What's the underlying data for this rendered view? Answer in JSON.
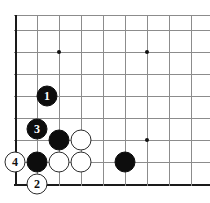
{
  "figure": {
    "kind": "go-board-diagram",
    "width": 210,
    "height": 203,
    "background_color": "#ffffff"
  },
  "board": {
    "line_color": "#8c8c8c",
    "edge_color": "#1a1a1a",
    "cell_size": 22,
    "vertical_lines_x": [
      15,
      37,
      59,
      81,
      103,
      125,
      147,
      169,
      191,
      213
    ],
    "horizontal_lines_y": [
      15,
      30,
      52,
      74,
      96,
      118,
      140,
      162,
      184
    ],
    "left_edge_x": 15,
    "bottom_edge_y": 184,
    "top_line_y": 15
  },
  "star_points": [
    {
      "name": "star-point-upper-left",
      "x": 59,
      "y": 52
    },
    {
      "name": "star-point-upper-right",
      "x": 147,
      "y": 52
    },
    {
      "name": "star-point-lower-left",
      "x": 59,
      "y": 140
    },
    {
      "name": "star-point-lower-right",
      "x": 147,
      "y": 140
    }
  ],
  "stones": [
    {
      "id": "stone-black-move-1",
      "color": "black",
      "label": "1",
      "x": 47,
      "y": 96
    },
    {
      "id": "stone-black-move-3",
      "color": "black",
      "label": "3",
      "x": 37,
      "y": 129
    },
    {
      "id": "stone-white-move-4",
      "color": "white",
      "label": "4",
      "x": 15,
      "y": 162
    },
    {
      "id": "stone-white-move-2",
      "color": "white",
      "label": "2",
      "x": 37,
      "y": 184
    },
    {
      "id": "stone-black-a",
      "color": "black",
      "label": "",
      "x": 59,
      "y": 140
    },
    {
      "id": "stone-black-b",
      "color": "black",
      "label": "",
      "x": 37,
      "y": 162
    },
    {
      "id": "stone-black-c",
      "color": "black",
      "label": "",
      "x": 125,
      "y": 162
    },
    {
      "id": "stone-white-a",
      "color": "white",
      "label": "",
      "x": 81,
      "y": 140
    },
    {
      "id": "stone-white-b",
      "color": "white",
      "label": "",
      "x": 59,
      "y": 162
    },
    {
      "id": "stone-white-c",
      "color": "white",
      "label": "",
      "x": 81,
      "y": 162
    }
  ],
  "move_sequence": [
    {
      "number": "1",
      "color": "black"
    },
    {
      "number": "2",
      "color": "white"
    },
    {
      "number": "3",
      "color": "black"
    },
    {
      "number": "4",
      "color": "white"
    }
  ]
}
